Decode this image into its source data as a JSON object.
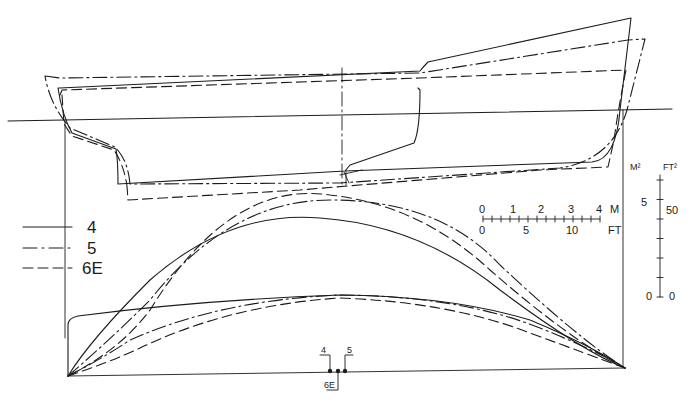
{
  "figure": {
    "type": "hull lines comparison: profile view and sectional area curves"
  },
  "legend": {
    "items": [
      {
        "label": "4",
        "style": "solid"
      },
      {
        "label": "5",
        "style": "dash-dot"
      },
      {
        "label": "6E",
        "style": "dashed"
      }
    ]
  },
  "length_scale": {
    "top_unit": "M",
    "bottom_unit": "FT",
    "metric_ticks": [
      "0",
      "1",
      "2",
      "3",
      "4"
    ],
    "feet_ticks": [
      "0",
      "5",
      "10"
    ]
  },
  "area_scale": {
    "left_unit": "M²",
    "right_unit": "FT²",
    "left_ticks": [
      "5",
      "0"
    ],
    "right_ticks": [
      "50",
      "0"
    ]
  },
  "lcb_markers": {
    "labels": [
      "4",
      "5",
      "6E"
    ]
  }
}
